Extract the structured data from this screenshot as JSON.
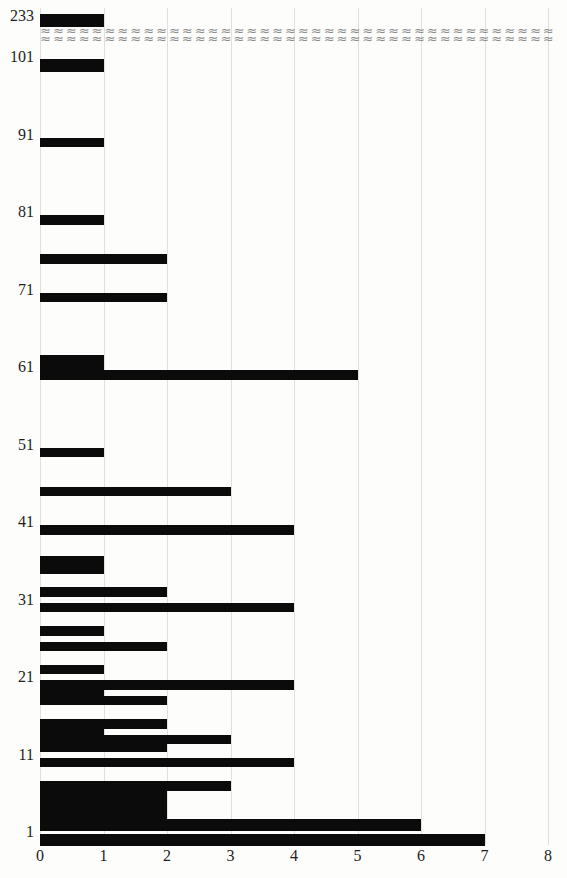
{
  "figure": {
    "background": "#fdfdfc",
    "bar_color": "#0b0b0b",
    "gridline_color": "#e0e0dd",
    "label_color": "#1d1d1b",
    "break_color": "#8c8c8c"
  },
  "chart_data": {
    "type": "bar",
    "orientation": "horizontal",
    "title": "",
    "xlabel": "",
    "ylabel": "",
    "xlim": [
      0,
      8
    ],
    "x_ticks": [
      "0",
      "1",
      "2",
      "3",
      "4",
      "5",
      "6",
      "7",
      "8"
    ],
    "y_ticks": [
      "1",
      "11",
      "21",
      "31",
      "41",
      "51",
      "61",
      "71",
      "81",
      "91",
      "101",
      "233"
    ],
    "grid": "vertical-only",
    "legend": "none",
    "axis_break": {
      "between": [
        "101",
        "233"
      ],
      "glyph": "≈",
      "rows": 2
    },
    "bars": [
      {
        "y": 233,
        "value": 1
      },
      {
        "y": 101,
        "value": 1
      },
      {
        "y": 91,
        "value": 1
      },
      {
        "y": 81,
        "value": 1
      },
      {
        "y": 76,
        "value": 2
      },
      {
        "y": 71,
        "value": 2
      },
      {
        "y": 63,
        "value": 1
      },
      {
        "y": 62,
        "value": 1
      },
      {
        "y": 61,
        "value": 5
      },
      {
        "y": 51,
        "value": 1
      },
      {
        "y": 46,
        "value": 3
      },
      {
        "y": 41,
        "value": 4
      },
      {
        "y": 37,
        "value": 1
      },
      {
        "y": 36,
        "value": 1
      },
      {
        "y": 33,
        "value": 2
      },
      {
        "y": 31,
        "value": 4
      },
      {
        "y": 28,
        "value": 1
      },
      {
        "y": 26,
        "value": 2
      },
      {
        "y": 23,
        "value": 1
      },
      {
        "y": 21,
        "value": 4
      },
      {
        "y": 20,
        "value": 1
      },
      {
        "y": 19,
        "value": 2
      },
      {
        "y": 16,
        "value": 2
      },
      {
        "y": 15,
        "value": 1
      },
      {
        "y": 14,
        "value": 3
      },
      {
        "y": 13,
        "value": 2
      },
      {
        "y": 11,
        "value": 4
      },
      {
        "y": 8,
        "value": 3
      },
      {
        "y": 7,
        "value": 2
      },
      {
        "y": 6,
        "value": 2
      },
      {
        "y": 5,
        "value": 2
      },
      {
        "y": 4,
        "value": 2
      },
      {
        "y": 3,
        "value": 6
      },
      {
        "y": 1,
        "value": 7
      }
    ]
  }
}
